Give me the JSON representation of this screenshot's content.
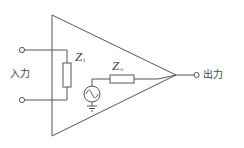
{
  "diagram": {
    "labels": {
      "input": "入力",
      "output": "出力",
      "input_impedance": {
        "symbol": "Z",
        "subscript": "i"
      },
      "output_impedance": {
        "symbol": "Z",
        "subscript": "o"
      }
    },
    "components": [
      {
        "id": "amplifier",
        "type": "triangle"
      },
      {
        "id": "input-impedance",
        "type": "resistor",
        "label": "Zi"
      },
      {
        "id": "output-impedance",
        "type": "resistor",
        "label": "Zo"
      },
      {
        "id": "ac-source",
        "type": "ac-voltage-source"
      },
      {
        "id": "ground",
        "type": "ground"
      },
      {
        "id": "input-terminal-top",
        "type": "terminal"
      },
      {
        "id": "input-terminal-bottom",
        "type": "terminal"
      },
      {
        "id": "output-terminal",
        "type": "terminal"
      }
    ],
    "colors": {
      "stroke": "#555555",
      "text": "#444444",
      "background": "#ffffff"
    }
  }
}
